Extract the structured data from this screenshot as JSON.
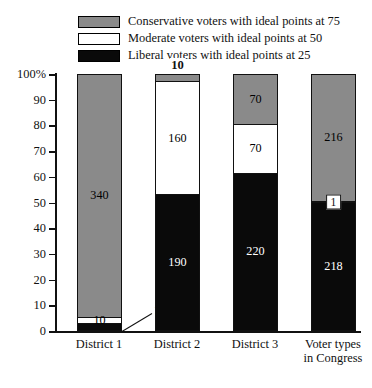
{
  "chart_data": {
    "type": "bar",
    "subtype": "stacked-bar-100-percent",
    "title": "",
    "xlabel": "",
    "ylabel": "",
    "ylim": [
      0,
      100
    ],
    "ytick_labels": [
      "100%",
      "90",
      "80",
      "70",
      "60",
      "50",
      "40",
      "30",
      "20",
      "10",
      "0"
    ],
    "ytick_values": [
      100,
      90,
      80,
      70,
      60,
      50,
      40,
      30,
      20,
      10,
      0
    ],
    "grid": false,
    "legend_position": "top",
    "categories": [
      "District 1",
      "District 2",
      "District 3",
      "Voter types in Congress"
    ],
    "series": [
      {
        "name": "Conservative voters with ideal points at 75",
        "color": "#8a8a8a",
        "values": [
          340,
          10,
          70,
          216
        ]
      },
      {
        "name": "Moderate voters with ideal points at 50",
        "color": "#ffffff",
        "values": [
          10,
          160,
          70,
          1
        ]
      },
      {
        "name": "Liberal voters with ideal points at 25",
        "color": "#0a0a0a",
        "values": [
          10,
          190,
          220,
          218
        ]
      }
    ],
    "totals": [
      360,
      360,
      360,
      435
    ],
    "annotations": [
      {
        "text": "10",
        "refers_to": "District 2 conservative segment",
        "placement": "above-bar"
      },
      {
        "text": "10",
        "refers_to": "District 1 liberal segment",
        "placement": "leader-line-right"
      },
      {
        "text": "1",
        "refers_to": "Voter types in Congress moderate segment",
        "placement": "boxed-inline"
      }
    ]
  },
  "legend": {
    "items": [
      {
        "label": "Conservative voters with ideal points at 75",
        "swatch": "conservative-swatch"
      },
      {
        "label": "Moderate voters with ideal points at 50",
        "swatch": "moderate-swatch"
      },
      {
        "label": "Liberal voters with ideal points at 25",
        "swatch": "liberal-swatch"
      }
    ]
  },
  "axis": {
    "y_labels": [
      "100%",
      "90",
      "80",
      "70",
      "60",
      "50",
      "40",
      "30",
      "20",
      "10",
      "0"
    ]
  },
  "bars": [
    {
      "category": "District 1",
      "label_line1": "District 1",
      "label_line2": "",
      "segments": [
        {
          "type": "conservative",
          "value": "340",
          "percent": 94.444,
          "inside": true
        },
        {
          "type": "moderate",
          "value": "10",
          "percent": 2.778,
          "inside": true
        },
        {
          "type": "liberal",
          "value": "10",
          "percent": 2.778,
          "inside": false
        }
      ],
      "outside_label": "10"
    },
    {
      "category": "District 2",
      "label_line1": "District 2",
      "label_line2": "",
      "above_label": "10",
      "segments": [
        {
          "type": "conservative",
          "value": "10",
          "percent": 2.778,
          "inside": false
        },
        {
          "type": "moderate",
          "value": "160",
          "percent": 44.444,
          "inside": true
        },
        {
          "type": "liberal",
          "value": "190",
          "percent": 52.778,
          "inside": true
        }
      ]
    },
    {
      "category": "District 3",
      "label_line1": "District 3",
      "label_line2": "",
      "segments": [
        {
          "type": "conservative",
          "value": "70",
          "percent": 19.444,
          "inside": true
        },
        {
          "type": "moderate",
          "value": "70",
          "percent": 19.444,
          "inside": true
        },
        {
          "type": "liberal",
          "value": "220",
          "percent": 61.111,
          "inside": true
        }
      ]
    },
    {
      "category": "Voter types in Congress",
      "label_line1": "Voter types",
      "label_line2": "in Congress",
      "segments": [
        {
          "type": "conservative",
          "value": "216",
          "percent": 49.655,
          "inside": true
        },
        {
          "type": "moderate",
          "value": "1",
          "percent": 0.23,
          "inside": false
        },
        {
          "type": "liberal",
          "value": "218",
          "percent": 50.115,
          "inside": true
        }
      ],
      "boxed_label": "1"
    }
  ],
  "colors": {
    "conservative": "#8a8a8a",
    "moderate": "#ffffff",
    "liberal": "#0a0a0a",
    "axis": "#111111",
    "background": "#ffffff"
  }
}
